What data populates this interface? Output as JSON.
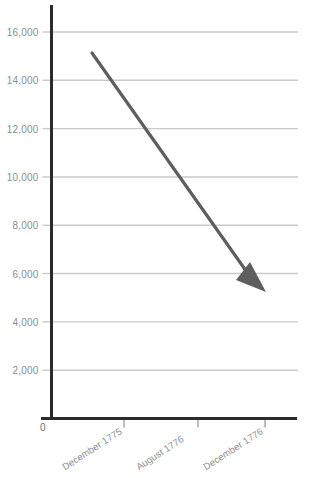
{
  "chart_data": {
    "type": "line",
    "title": "",
    "subtitle": "",
    "xlabel": "",
    "ylabel": "",
    "categories": [
      "December 1775",
      "August 1776",
      "December 1776"
    ],
    "series": [
      {
        "name": "Troop strength",
        "values": [
          15000,
          null,
          5800
        ]
      }
    ],
    "annotation": {
      "kind": "arrow",
      "from_label": "December 1775",
      "from_value": 15000,
      "to_label": "December 1776",
      "to_value": 5800,
      "direction": "down-right",
      "color": "#5e5e5e"
    },
    "ylim": [
      0,
      17000
    ],
    "ytick_values": [
      2000,
      4000,
      6000,
      8000,
      10000,
      12000,
      14000,
      16000
    ],
    "ytick_labels": [
      "2,000",
      "4,000",
      "6,000",
      "8,000",
      "10,000",
      "12,000",
      "14,000",
      "16,000"
    ],
    "origin_label": "0",
    "grid": true,
    "grid_axis": "y",
    "legend": "none",
    "xtick_label_rotation_deg": -33
  },
  "style": {
    "background": "#ffffff",
    "axis_color": "#2b2b2b",
    "grid_color": "#c9c9c9",
    "tick_text_color": "#8d8d8d",
    "arrow_color": "#5e5e5e"
  }
}
